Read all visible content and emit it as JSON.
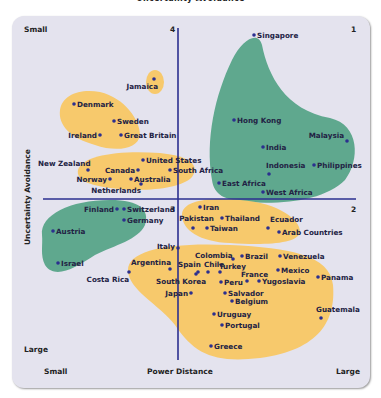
{
  "chart_data": {
    "type": "scatter",
    "title": "Uncertainty Avoidance",
    "xlabel": "Power Distance",
    "ylabel": "Uncertainty Avoidance",
    "x_ends": {
      "left": "Small",
      "right": "Large"
    },
    "y_ends": {
      "top": "Small",
      "bottom": "Large"
    },
    "quadrants": [
      "1",
      "2",
      "3",
      "4"
    ],
    "colors": {
      "panel": "#e4e3ee",
      "yellow_cluster": "#f7c96c",
      "green_cluster": "#5fa88e",
      "axis": "#2b2f8f",
      "dot": "#2b2f8f"
    },
    "points": [
      {
        "name": "Singapore",
        "x": 254,
        "y": 35,
        "cluster": "green"
      },
      {
        "name": "Jamaica",
        "x": 154,
        "y": 79,
        "cluster": "yellow"
      },
      {
        "name": "Denmark",
        "x": 74,
        "y": 104,
        "cluster": "yellow"
      },
      {
        "name": "Sweden",
        "x": 114,
        "y": 121,
        "cluster": "yellow"
      },
      {
        "name": "Ireland",
        "x": 100,
        "y": 135,
        "cluster": "yellow"
      },
      {
        "name": "Great Britain",
        "x": 121,
        "y": 135,
        "cluster": "yellow"
      },
      {
        "name": "Hong Kong",
        "x": 234,
        "y": 120,
        "cluster": "green"
      },
      {
        "name": "Malaysia",
        "x": 347,
        "y": 141,
        "cluster": "green"
      },
      {
        "name": "India",
        "x": 263,
        "y": 147,
        "cluster": "green"
      },
      {
        "name": "United States",
        "x": 143,
        "y": 160,
        "cluster": "yellow"
      },
      {
        "name": "New Zealand",
        "x": 88,
        "y": 170,
        "cluster": "yellow"
      },
      {
        "name": "Canada",
        "x": 138,
        "y": 170,
        "cluster": "yellow"
      },
      {
        "name": "South Africa",
        "x": 170,
        "y": 170,
        "cluster": "yellow"
      },
      {
        "name": "Norway",
        "x": 110,
        "y": 179,
        "cluster": "yellow"
      },
      {
        "name": "Australia",
        "x": 131,
        "y": 179,
        "cluster": "yellow"
      },
      {
        "name": "Netherlands",
        "x": 141,
        "y": 184,
        "cluster": "yellow"
      },
      {
        "name": "Indonesia",
        "x": 269,
        "y": 174,
        "cluster": "green"
      },
      {
        "name": "Philippines",
        "x": 314,
        "y": 165,
        "cluster": "green"
      },
      {
        "name": "East Africa",
        "x": 219,
        "y": 183,
        "cluster": "green"
      },
      {
        "name": "West Africa",
        "x": 263,
        "y": 192,
        "cluster": "green"
      },
      {
        "name": "Finland",
        "x": 117,
        "y": 209,
        "cluster": "green"
      },
      {
        "name": "Switzerland",
        "x": 124,
        "y": 209,
        "cluster": "green"
      },
      {
        "name": "Germany",
        "x": 124,
        "y": 220,
        "cluster": "green"
      },
      {
        "name": "Austria",
        "x": 53,
        "y": 231,
        "cluster": "green"
      },
      {
        "name": "Israel",
        "x": 58,
        "y": 263,
        "cluster": "green"
      },
      {
        "name": "Iran",
        "x": 200,
        "y": 207,
        "cluster": "yellow"
      },
      {
        "name": "Pakistan",
        "x": 193,
        "y": 228,
        "cluster": "yellow"
      },
      {
        "name": "Thailand",
        "x": 222,
        "y": 218,
        "cluster": "yellow"
      },
      {
        "name": "Taiwan",
        "x": 207,
        "y": 228,
        "cluster": "yellow"
      },
      {
        "name": "Ecuador",
        "x": 268,
        "y": 228,
        "cluster": "yellow"
      },
      {
        "name": "Arab Countries",
        "x": 279,
        "y": 232,
        "cluster": "yellow"
      },
      {
        "name": "Italy",
        "x": 178,
        "y": 248,
        "cluster": "yellow"
      },
      {
        "name": "Colombia",
        "x": 233,
        "y": 259,
        "cluster": "yellow"
      },
      {
        "name": "Brazil",
        "x": 242,
        "y": 256,
        "cluster": "yellow"
      },
      {
        "name": "Venezuela",
        "x": 280,
        "y": 256,
        "cluster": "yellow"
      },
      {
        "name": "Argentina",
        "x": 170,
        "y": 269,
        "cluster": "yellow"
      },
      {
        "name": "Spain",
        "x": 198,
        "y": 272,
        "cluster": "yellow"
      },
      {
        "name": "Chile",
        "x": 208,
        "y": 272,
        "cluster": "yellow"
      },
      {
        "name": "Turkey",
        "x": 220,
        "y": 272,
        "cluster": "yellow"
      },
      {
        "name": "Mexico",
        "x": 278,
        "y": 270,
        "cluster": "yellow"
      },
      {
        "name": "Costa Rica",
        "x": 129,
        "y": 272,
        "cluster": "yellow"
      },
      {
        "name": "France",
        "x": 247,
        "y": 281,
        "cluster": "yellow"
      },
      {
        "name": "Panama",
        "x": 318,
        "y": 277,
        "cluster": "yellow"
      },
      {
        "name": "South Korea",
        "x": 196,
        "y": 274,
        "cluster": "yellow"
      },
      {
        "name": "Peru",
        "x": 221,
        "y": 282,
        "cluster": "yellow"
      },
      {
        "name": "Yugoslavia",
        "x": 259,
        "y": 281,
        "cluster": "yellow"
      },
      {
        "name": "Japan",
        "x": 191,
        "y": 293,
        "cluster": "yellow"
      },
      {
        "name": "Salvador",
        "x": 225,
        "y": 293,
        "cluster": "yellow"
      },
      {
        "name": "Belgium",
        "x": 232,
        "y": 301,
        "cluster": "yellow"
      },
      {
        "name": "Uruguay",
        "x": 214,
        "y": 314,
        "cluster": "yellow"
      },
      {
        "name": "Portugal",
        "x": 222,
        "y": 325,
        "cluster": "yellow"
      },
      {
        "name": "Guatemala",
        "x": 321,
        "y": 318,
        "cluster": "yellow"
      },
      {
        "name": "Greece",
        "x": 211,
        "y": 346,
        "cluster": "yellow"
      }
    ],
    "legend": null,
    "grid": false
  },
  "labels": {
    "title": "Uncertainty Avoidance",
    "top_small": "Small",
    "bottom_large": "Large",
    "x_small": "Small",
    "x_title": "Power Distance",
    "x_large": "Large",
    "y_title": "Uncertainty Avoidance",
    "q1": "1",
    "q2": "2",
    "q3": "3",
    "q4": "4"
  }
}
